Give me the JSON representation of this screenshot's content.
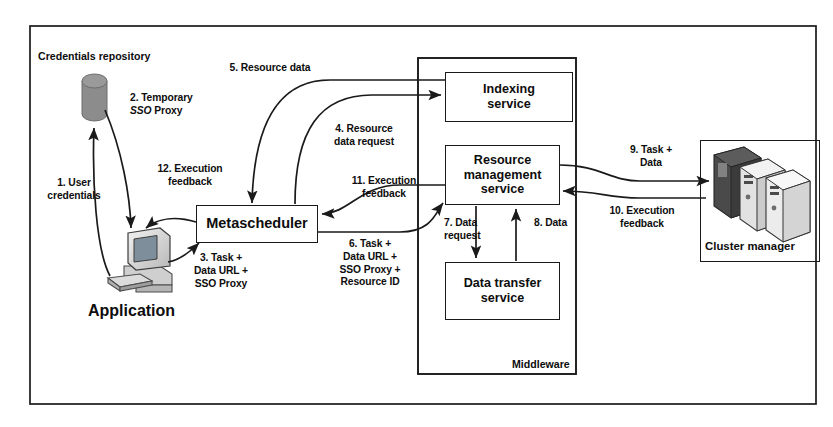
{
  "diagram": {
    "title_label": "Middleware",
    "nodes": {
      "credentials_repository": "Credentials repository",
      "application": "Application",
      "metascheduler": "Metascheduler",
      "indexing_service": "Indexing\nservice",
      "resource_management_service": "Resource\nmanagement\nservice",
      "data_transfer_service": "Data transfer\nservice",
      "cluster_manager": "Cluster manager"
    },
    "flows": [
      {
        "id": "1",
        "label": "1. User\ncredentials"
      },
      {
        "id": "2",
        "label_line1": "2. Temporary",
        "label_line2_italic": "SSO",
        "label_line2_rest": " Proxy"
      },
      {
        "id": "3",
        "label": "3. Task +\nData URL +\nSSO Proxy"
      },
      {
        "id": "4",
        "label": "4. Resource\ndata request"
      },
      {
        "id": "5",
        "label": "5. Resource data"
      },
      {
        "id": "6",
        "label": "6. Task +\nData URL +\nSSO Proxy +\nResource ID"
      },
      {
        "id": "7",
        "label": "7. Data\nrequest"
      },
      {
        "id": "8",
        "label": "8. Data"
      },
      {
        "id": "9",
        "label": "9.  Task +\nData"
      },
      {
        "id": "10",
        "label": "10. Execution\nfeedback"
      },
      {
        "id": "11",
        "label": "11. Execution\nfeedback"
      },
      {
        "id": "12",
        "label": "12. Execution\nfeedback"
      }
    ],
    "colors": {
      "stroke": "#1a1a1a",
      "text": "#0d0d0d",
      "cylinder_fill": "#8c8c8c",
      "server_dark": "#4a4a4a",
      "server_light": "#e2e2e2",
      "background": "#ffffff"
    }
  }
}
